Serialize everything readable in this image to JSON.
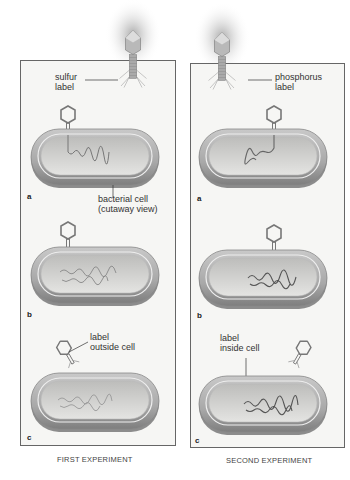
{
  "diagram": {
    "type": "Hershey-Chase experiment illustration",
    "experiments": [
      {
        "caption": "FIRST EXPERIMENT",
        "top_label": "sulfur\nlabel",
        "steps": [
          {
            "letter": "a",
            "annotation": "bacterial cell\n(cutaway view)"
          },
          {
            "letter": "b",
            "annotation": ""
          },
          {
            "letter": "c",
            "annotation": "label\noutside cell"
          }
        ]
      },
      {
        "caption": "SECOND EXPERIMENT",
        "top_label": "phosphorus\nlabel",
        "steps": [
          {
            "letter": "a",
            "annotation": ""
          },
          {
            "letter": "b",
            "annotation": ""
          },
          {
            "letter": "c",
            "annotation": "label\ninside cell"
          }
        ]
      }
    ],
    "footer_mark": "Fi..."
  },
  "colors": {
    "panel_border": "#666666",
    "panel_bg": "#f6f6f4",
    "cell_outer": "#9a9a9a",
    "cell_inner": "#d8d8d6",
    "dna": "#777777",
    "phage_glow": "#bbbbbb"
  }
}
